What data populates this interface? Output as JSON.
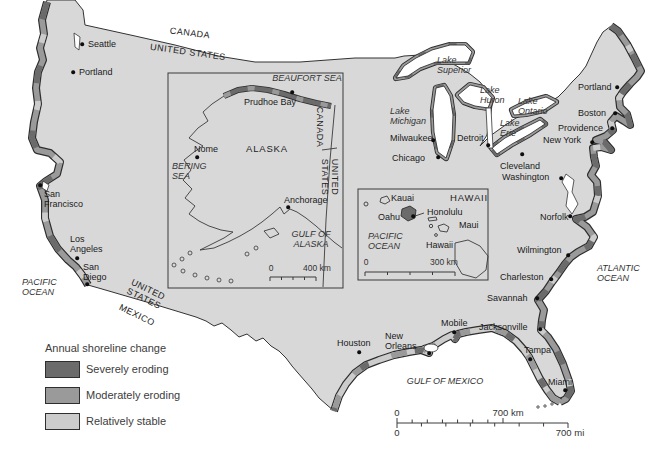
{
  "colors": {
    "land": "#d8d8d8",
    "severe": "#6b6b6b",
    "moderate": "#9a9a9a",
    "stable": "#cccccc",
    "outline": "#333333",
    "water": "#ffffff"
  },
  "legend": {
    "title": "Annual shoreline change",
    "items": [
      {
        "label": "Severely eroding",
        "color": "severe"
      },
      {
        "label": "Moderately eroding",
        "color": "moderate"
      },
      {
        "label": "Relatively stable",
        "color": "stable"
      }
    ]
  },
  "scales": {
    "main": {
      "zero_km": "0",
      "km": "700 km",
      "zero_mi": "0",
      "mi": "700 mi"
    },
    "alaska": {
      "zero": "0",
      "label": "400 km"
    },
    "hawaii": {
      "zero": "0",
      "label": "300 km"
    }
  },
  "cities": [
    {
      "n": "Seattle",
      "lx": 88,
      "ly": 44,
      "a": "l",
      "dx": 82,
      "dy": 44
    },
    {
      "n": "Portland",
      "lx": 79,
      "ly": 72,
      "a": "l",
      "dx": 73,
      "dy": 72
    },
    {
      "n": "San\nFrancisco",
      "lx": 44,
      "ly": 199,
      "a": "l",
      "dx": 40,
      "dy": 185
    },
    {
      "n": "Los\nAngeles",
      "lx": 70,
      "ly": 244,
      "a": "l",
      "dx": 77,
      "dy": 258
    },
    {
      "n": "San\nDiego",
      "lx": 83,
      "ly": 272,
      "a": "l",
      "dx": 87,
      "dy": 284
    },
    {
      "n": "Houston",
      "lx": 337,
      "ly": 343,
      "a": "l",
      "dx": 359,
      "dy": 352
    },
    {
      "n": "New\nOrleans",
      "lx": 385,
      "ly": 341,
      "a": "l",
      "dx": 429,
      "dy": 353
    },
    {
      "n": "Mobile",
      "lx": 441,
      "ly": 323,
      "a": "l",
      "dx": 454,
      "dy": 332
    },
    {
      "n": "Jacksonville",
      "lx": 479,
      "ly": 327,
      "a": "l",
      "dx": 540,
      "dy": 329
    },
    {
      "n": "Tampa",
      "lx": 524,
      "ly": 350,
      "a": "l",
      "dx": 530,
      "dy": 359
    },
    {
      "n": "Miami",
      "lx": 548,
      "ly": 382,
      "a": "l",
      "dx": 565,
      "dy": 390
    },
    {
      "n": "Savannah",
      "lx": 487,
      "ly": 298,
      "a": "l",
      "dx": 537,
      "dy": 298
    },
    {
      "n": "Charleston",
      "lx": 500,
      "ly": 277,
      "a": "l",
      "dx": 551,
      "dy": 279
    },
    {
      "n": "Wilmington",
      "lx": 517,
      "ly": 250,
      "a": "l",
      "dx": 568,
      "dy": 255
    },
    {
      "n": "Norfolk",
      "lx": 540,
      "ly": 217,
      "a": "l",
      "dx": 570,
      "dy": 216
    },
    {
      "n": "Washington",
      "lx": 502,
      "ly": 177,
      "a": "l",
      "dx": 561,
      "dy": 178
    },
    {
      "n": "Cleveland",
      "lx": 500,
      "ly": 166,
      "a": "l",
      "dx": 522,
      "dy": 154
    },
    {
      "n": "New York",
      "lx": 543,
      "ly": 140,
      "a": "l",
      "dx": 592,
      "dy": 142
    },
    {
      "n": "Providence",
      "lx": 558,
      "ly": 128,
      "a": "l",
      "dx": 612,
      "dy": 128
    },
    {
      "n": "Boston",
      "lx": 578,
      "ly": 113,
      "a": "l",
      "dx": 615,
      "dy": 113
    },
    {
      "n": "Portland",
      "lx": 578,
      "ly": 87,
      "a": "l",
      "dx": 617,
      "dy": 87
    },
    {
      "n": "Milwaukee",
      "lx": 390,
      "ly": 138,
      "a": "l",
      "dx": 433,
      "dy": 140
    },
    {
      "n": "Chicago",
      "lx": 392,
      "ly": 158,
      "a": "l",
      "dx": 438,
      "dy": 157
    },
    {
      "n": "Detroit",
      "lx": 457,
      "ly": 138,
      "a": "l",
      "dx": 488,
      "dy": 145
    },
    {
      "n": "Prudhoe Bay",
      "lx": 244,
      "ly": 102,
      "a": "l",
      "dx": 292,
      "dy": 92
    },
    {
      "n": "Nome",
      "lx": 194,
      "ly": 149,
      "a": "l",
      "dx": 197,
      "dy": 157
    },
    {
      "n": "Anchorage",
      "lx": 284,
      "ly": 200,
      "a": "l",
      "dx": 288,
      "dy": 207
    },
    {
      "n": "Honolulu",
      "lx": 427,
      "ly": 212,
      "a": "l",
      "dx": 413,
      "dy": 216
    }
  ],
  "map_labels": [
    {
      "t": "CANADA",
      "x": 190,
      "y": 33,
      "cls": "bord",
      "rot": 7,
      "a": "c"
    },
    {
      "t": "UNITED STATES",
      "x": 188,
      "y": 52,
      "cls": "bord",
      "rot": 8,
      "a": "c"
    },
    {
      "t": "BEAUFORT SEA",
      "x": 307,
      "y": 78,
      "cls": "sea",
      "rot": 0,
      "a": "c"
    },
    {
      "t": "CANADA",
      "x": 320,
      "y": 127,
      "cls": "bord",
      "rot": 90,
      "a": "c"
    },
    {
      "t": "UNITED\nSTATES",
      "x": 330,
      "y": 177,
      "cls": "bord",
      "rot": 90,
      "a": "c"
    },
    {
      "t": "ALASKA",
      "x": 267,
      "y": 149,
      "cls": "reg",
      "rot": 0,
      "a": "c"
    },
    {
      "t": "BERING\nSEA",
      "x": 172,
      "y": 171,
      "cls": "sea",
      "rot": 0,
      "a": "l"
    },
    {
      "t": "GULF OF\nALASKA",
      "x": 311,
      "y": 239,
      "cls": "sea",
      "rot": 0,
      "a": "c"
    },
    {
      "t": "HAWAII",
      "x": 469,
      "y": 198,
      "cls": "reg",
      "rot": 0,
      "a": "c"
    },
    {
      "t": "Kauai",
      "x": 391,
      "y": 198,
      "cls": "city",
      "rot": 0,
      "a": "l"
    },
    {
      "t": "Oahu",
      "x": 378,
      "y": 217,
      "cls": "city",
      "rot": 0,
      "a": "l"
    },
    {
      "t": "Maui",
      "x": 459,
      "y": 225,
      "cls": "city",
      "rot": 0,
      "a": "l"
    },
    {
      "t": "Hawaii",
      "x": 426,
      "y": 245,
      "cls": "city",
      "rot": 0,
      "a": "l"
    },
    {
      "t": "PACIFIC\nOCEAN",
      "x": 368,
      "y": 241,
      "cls": "sea",
      "rot": 0,
      "a": "l"
    },
    {
      "t": "PACIFIC\nOCEAN",
      "x": 22,
      "y": 287,
      "cls": "sea",
      "rot": 0,
      "a": "l"
    },
    {
      "t": "ATLANTIC\nOCEAN",
      "x": 597,
      "y": 273,
      "cls": "sea",
      "rot": 0,
      "a": "l"
    },
    {
      "t": "GULF OF MEXICO",
      "x": 445,
      "y": 381,
      "cls": "sea",
      "rot": 0,
      "a": "c"
    },
    {
      "t": "UNITED\nSTATES",
      "x": 146,
      "y": 294,
      "cls": "bord",
      "rot": 26,
      "a": "c"
    },
    {
      "t": "MEXICO",
      "x": 137,
      "y": 315,
      "cls": "bord",
      "rot": 26,
      "a": "c"
    },
    {
      "t": "Lake\nSuperior",
      "x": 437,
      "y": 65,
      "cls": "sea",
      "rot": 0,
      "a": "l"
    },
    {
      "t": "Lake\nHuron",
      "x": 480,
      "y": 95,
      "cls": "sea",
      "rot": 0,
      "a": "l"
    },
    {
      "t": "Lake\nMichigan",
      "x": 390,
      "y": 116,
      "cls": "sea",
      "rot": 0,
      "a": "l"
    },
    {
      "t": "Lake\nOntario",
      "x": 518,
      "y": 106,
      "cls": "sea",
      "rot": 0,
      "a": "l"
    },
    {
      "t": "Lake\nErie",
      "x": 500,
      "y": 128,
      "cls": "sea",
      "rot": 0,
      "a": "l"
    }
  ]
}
